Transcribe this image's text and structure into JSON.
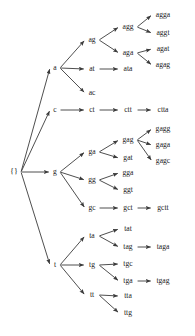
{
  "diagram": {
    "type": "tree",
    "background_color": "#ffffff",
    "edge_color": "#3b3b3b",
    "text_color": "#1a1a1a",
    "root_label": "{}",
    "nodes": [
      {
        "id": "root",
        "label": "{}",
        "x": 14,
        "y": 172,
        "level": 0
      },
      {
        "id": "a",
        "label": "a",
        "x": 55,
        "y": 68,
        "level": 1
      },
      {
        "id": "c",
        "label": "c",
        "x": 55,
        "y": 110,
        "level": 1
      },
      {
        "id": "g",
        "label": "g",
        "x": 55,
        "y": 172,
        "level": 1
      },
      {
        "id": "t",
        "label": "t",
        "x": 55,
        "y": 265,
        "level": 1
      },
      {
        "id": "ag",
        "label": "ag",
        "x": 92,
        "y": 40,
        "level": 2
      },
      {
        "id": "at",
        "label": "at",
        "x": 92,
        "y": 69,
        "level": 2
      },
      {
        "id": "ac",
        "label": "ac",
        "x": 92,
        "y": 93,
        "level": 2
      },
      {
        "id": "ct",
        "label": "ct",
        "x": 92,
        "y": 110,
        "level": 2
      },
      {
        "id": "ga",
        "label": "ga",
        "x": 92,
        "y": 152,
        "level": 2
      },
      {
        "id": "gg",
        "label": "gg",
        "x": 92,
        "y": 180,
        "level": 2
      },
      {
        "id": "gc",
        "label": "gc",
        "x": 92,
        "y": 208,
        "level": 2
      },
      {
        "id": "ta",
        "label": "ta",
        "x": 92,
        "y": 236,
        "level": 2
      },
      {
        "id": "tg",
        "label": "tg",
        "x": 92,
        "y": 265,
        "level": 2
      },
      {
        "id": "tt",
        "label": "tt",
        "x": 92,
        "y": 295,
        "level": 2
      },
      {
        "id": "agg",
        "label": "agg",
        "x": 128,
        "y": 27,
        "level": 3
      },
      {
        "id": "aga",
        "label": "aga",
        "x": 128,
        "y": 53,
        "level": 3
      },
      {
        "id": "ata",
        "label": "ata",
        "x": 128,
        "y": 69,
        "level": 3
      },
      {
        "id": "ctt",
        "label": "ctt",
        "x": 128,
        "y": 110,
        "level": 3
      },
      {
        "id": "gag",
        "label": "gag",
        "x": 128,
        "y": 140,
        "level": 3
      },
      {
        "id": "gat",
        "label": "gat",
        "x": 128,
        "y": 158,
        "level": 3
      },
      {
        "id": "gga",
        "label": "gga",
        "x": 128,
        "y": 173,
        "level": 3
      },
      {
        "id": "ggt",
        "label": "ggt",
        "x": 128,
        "y": 190,
        "level": 3
      },
      {
        "id": "gct",
        "label": "gct",
        "x": 128,
        "y": 208,
        "level": 3
      },
      {
        "id": "tat",
        "label": "tat",
        "x": 128,
        "y": 229,
        "level": 3
      },
      {
        "id": "tag",
        "label": "tag",
        "x": 128,
        "y": 247,
        "level": 3
      },
      {
        "id": "tgc",
        "label": "tgc",
        "x": 128,
        "y": 264,
        "level": 3
      },
      {
        "id": "tga",
        "label": "tga",
        "x": 128,
        "y": 281,
        "level": 3
      },
      {
        "id": "tta",
        "label": "tta",
        "x": 128,
        "y": 296,
        "level": 3
      },
      {
        "id": "ttg",
        "label": "ttg",
        "x": 128,
        "y": 313,
        "level": 3
      },
      {
        "id": "agga",
        "label": "agga",
        "x": 163,
        "y": 15,
        "level": 4
      },
      {
        "id": "aggt",
        "label": "aggt",
        "x": 163,
        "y": 33,
        "level": 4
      },
      {
        "id": "agat",
        "label": "agat",
        "x": 163,
        "y": 49,
        "level": 4
      },
      {
        "id": "agag",
        "label": "agag",
        "x": 163,
        "y": 65,
        "level": 4
      },
      {
        "id": "ctta",
        "label": "ctta",
        "x": 163,
        "y": 110,
        "level": 4
      },
      {
        "id": "gagg",
        "label": "gagg",
        "x": 163,
        "y": 129,
        "level": 4
      },
      {
        "id": "gaga",
        "label": "gaga",
        "x": 163,
        "y": 145,
        "level": 4
      },
      {
        "id": "gagc",
        "label": "gagc",
        "x": 163,
        "y": 161,
        "level": 4
      },
      {
        "id": "gctt",
        "label": "gctt",
        "x": 163,
        "y": 208,
        "level": 4
      },
      {
        "id": "taga",
        "label": "taga",
        "x": 163,
        "y": 247,
        "level": 4
      },
      {
        "id": "tgag",
        "label": "tgag",
        "x": 163,
        "y": 281,
        "level": 4
      }
    ],
    "edges": [
      {
        "from": "root",
        "to": "a"
      },
      {
        "from": "root",
        "to": "c"
      },
      {
        "from": "root",
        "to": "g"
      },
      {
        "from": "root",
        "to": "t"
      },
      {
        "from": "a",
        "to": "ag"
      },
      {
        "from": "a",
        "to": "at"
      },
      {
        "from": "a",
        "to": "ac"
      },
      {
        "from": "c",
        "to": "ct"
      },
      {
        "from": "g",
        "to": "ga"
      },
      {
        "from": "g",
        "to": "gg"
      },
      {
        "from": "g",
        "to": "gc"
      },
      {
        "from": "t",
        "to": "ta"
      },
      {
        "from": "t",
        "to": "tg"
      },
      {
        "from": "t",
        "to": "tt"
      },
      {
        "from": "ag",
        "to": "agg"
      },
      {
        "from": "ag",
        "to": "aga"
      },
      {
        "from": "at",
        "to": "ata"
      },
      {
        "from": "ct",
        "to": "ctt"
      },
      {
        "from": "ga",
        "to": "gag"
      },
      {
        "from": "ga",
        "to": "gat"
      },
      {
        "from": "gg",
        "to": "gga"
      },
      {
        "from": "gg",
        "to": "ggt"
      },
      {
        "from": "gc",
        "to": "gct"
      },
      {
        "from": "ta",
        "to": "tat"
      },
      {
        "from": "ta",
        "to": "tag"
      },
      {
        "from": "tg",
        "to": "tgc"
      },
      {
        "from": "tg",
        "to": "tga"
      },
      {
        "from": "tt",
        "to": "tta"
      },
      {
        "from": "tt",
        "to": "ttg"
      },
      {
        "from": "agg",
        "to": "agga"
      },
      {
        "from": "agg",
        "to": "aggt"
      },
      {
        "from": "aga",
        "to": "agat"
      },
      {
        "from": "aga",
        "to": "agag"
      },
      {
        "from": "ctt",
        "to": "ctta"
      },
      {
        "from": "gag",
        "to": "gagg"
      },
      {
        "from": "gag",
        "to": "gaga"
      },
      {
        "from": "gag",
        "to": "gagc"
      },
      {
        "from": "gct",
        "to": "gctt"
      },
      {
        "from": "tag",
        "to": "taga"
      },
      {
        "from": "tga",
        "to": "tgag"
      }
    ]
  }
}
